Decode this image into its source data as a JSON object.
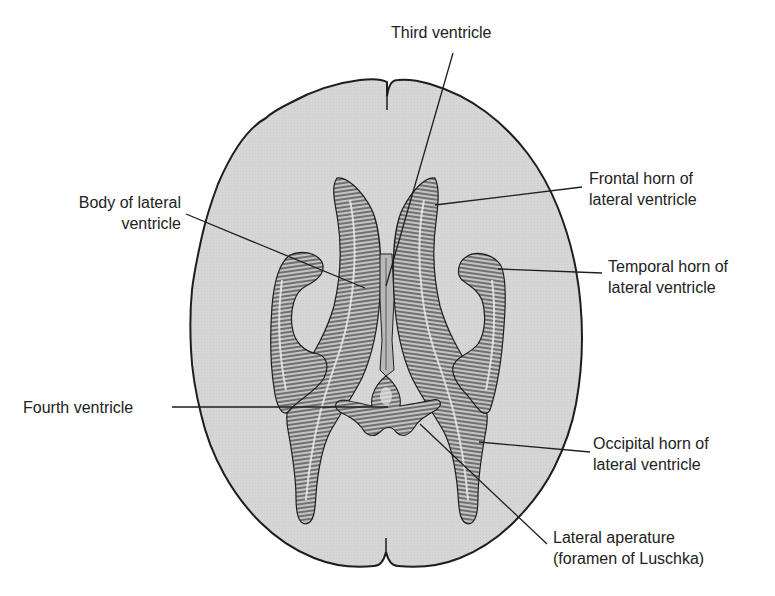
{
  "diagram": {
    "colors": {
      "background": "#ffffff",
      "brain_fill": "#d6d6d6",
      "outline": "#1e1e1e",
      "ventricle_fill": "#bdbdbd",
      "hatch": "#2a2a2a",
      "leader": "#1e1e1e",
      "text": "#222222"
    },
    "labels": {
      "third_ventricle": {
        "lines": [
          "Third ventricle"
        ]
      },
      "body_lateral": {
        "lines": [
          "Body of lateral",
          "ventricle"
        ]
      },
      "frontal_horn": {
        "lines": [
          "Frontal horn of",
          "lateral ventricle"
        ]
      },
      "temporal_horn": {
        "lines": [
          "Temporal horn of",
          "lateral ventricle"
        ]
      },
      "fourth_ventricle": {
        "lines": [
          "Fourth ventricle"
        ]
      },
      "occipital_horn": {
        "lines": [
          "Occipital horn of",
          "lateral ventricle"
        ]
      },
      "lateral_aperture": {
        "lines": [
          "Lateral aperature",
          "(foramen of Luschka)"
        ]
      }
    }
  }
}
